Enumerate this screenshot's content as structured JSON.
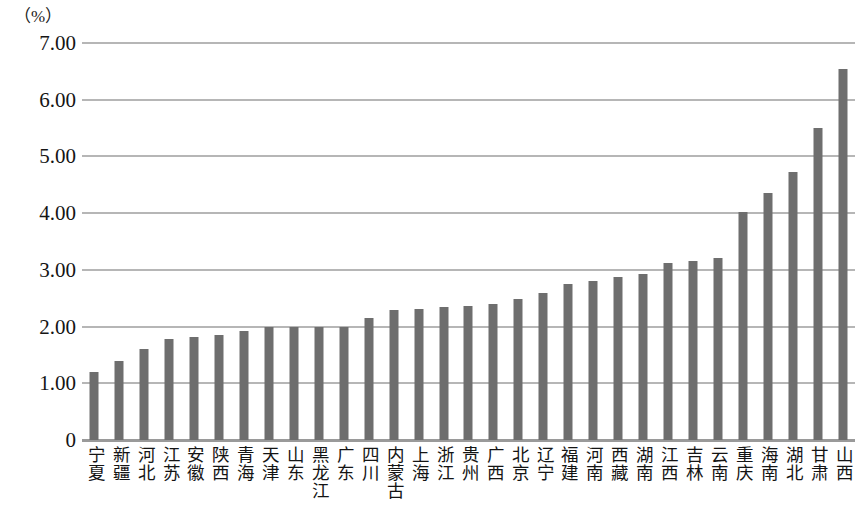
{
  "chart_data": {
    "type": "bar",
    "title": "",
    "subtitle": "",
    "unit_label": "（%）",
    "xlabel": "",
    "ylabel": "",
    "ylim": [
      0,
      7.0
    ],
    "ytick_labels": [
      "7.00",
      "6.00",
      "5.00",
      "4.00",
      "3.00",
      "2.00",
      "1.00",
      "0"
    ],
    "ytick_values": [
      7.0,
      6.0,
      5.0,
      4.0,
      3.0,
      2.0,
      1.0,
      0
    ],
    "grid": true,
    "grid_axis": "y",
    "legend": false,
    "legend_position": "none",
    "bar_color": "#6e6e6e",
    "gridline_color": "#b6b6b6",
    "axis_color": "#9a9a9a",
    "sorted": "ascending",
    "categories": [
      "宁夏",
      "新疆",
      "河北",
      "江苏",
      "安徽",
      "陕西",
      "青海",
      "天津",
      "山东",
      "黑龙江",
      "广东",
      "四川",
      "内蒙古",
      "上海",
      "浙江",
      "贵州",
      "广西",
      "北京",
      "辽宁",
      "福建",
      "河南",
      "西藏",
      "湖南",
      "江西",
      "吉林",
      "云南",
      "重庆",
      "海南",
      "湖北",
      "甘肃",
      "山西"
    ],
    "values": [
      1.2,
      1.4,
      1.6,
      1.78,
      1.82,
      1.86,
      1.92,
      2.0,
      2.0,
      2.0,
      2.0,
      2.16,
      2.3,
      2.31,
      2.34,
      2.37,
      2.4,
      2.48,
      2.6,
      2.75,
      2.8,
      2.88,
      2.92,
      3.12,
      3.15,
      3.21,
      4.02,
      4.36,
      4.73,
      5.5,
      6.55
    ]
  }
}
